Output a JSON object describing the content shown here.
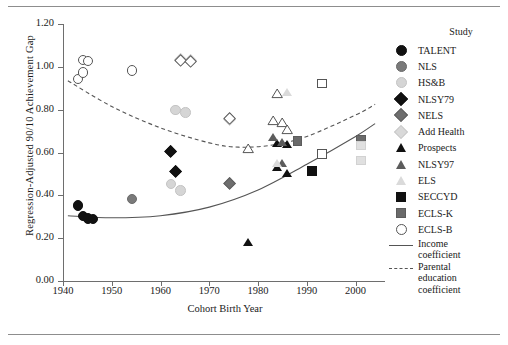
{
  "figure": {
    "legend_title": "Study",
    "line_legend": [
      {
        "id": "income",
        "label_lines": [
          "Income",
          "coefficient"
        ],
        "style": "solid",
        "color": "#555555"
      },
      {
        "id": "parental",
        "label_lines": [
          "Parental",
          "education",
          "coefficient"
        ],
        "style": "dashed",
        "color": "#555555"
      }
    ]
  },
  "chart_data": {
    "type": "scatter",
    "title": "",
    "xlabel": "Cohort Birth Year",
    "ylabel": "Regression-Adjusted 90/10 Achievement Gap",
    "xlim": [
      1940,
      2005
    ],
    "ylim": [
      0.0,
      1.2
    ],
    "xticks": [
      1940,
      1950,
      1960,
      1970,
      1980,
      1990,
      2000
    ],
    "yticks": [
      "0.00",
      "0.20",
      "0.40",
      "0.60",
      "0.80",
      "1.00",
      "1.20"
    ],
    "grid": false,
    "legend_position": "right",
    "series": [
      {
        "name": "TALENT",
        "marker": "circle",
        "fill": "#111111",
        "edge": "#111111",
        "points": [
          [
            1943,
            0.355
          ],
          [
            1944,
            0.305
          ],
          [
            1945,
            0.295
          ],
          [
            1946,
            0.292
          ]
        ]
      },
      {
        "name": "NLS",
        "marker": "circle",
        "fill": "#7a7a7a",
        "edge": "#6a6a6a",
        "points": [
          [
            1954,
            0.385
          ]
        ]
      },
      {
        "name": "HS&B",
        "marker": "circle",
        "fill": "#d5d5d5",
        "edge": "#c4c4c4",
        "points": [
          [
            1962,
            0.455
          ],
          [
            1964,
            0.425
          ],
          [
            1963,
            0.8
          ],
          [
            1965,
            0.79
          ]
        ]
      },
      {
        "name": "NLSY79",
        "marker": "diamond",
        "fill": "#111111",
        "edge": "#111111",
        "points": [
          [
            1962,
            0.605
          ],
          [
            1963,
            0.515
          ]
        ]
      },
      {
        "name": "NELS",
        "marker": "diamond",
        "fill": "#6e6e6e",
        "edge": "#5f5f5f",
        "points": [
          [
            1974,
            0.455
          ]
        ]
      },
      {
        "name": "Add Health",
        "marker": "diamond",
        "fill": "#d9d9d9",
        "edge": "#c9c9c9",
        "points": [
          [
            1964,
            1.035
          ],
          [
            1966,
            1.03
          ],
          [
            1974,
            0.755
          ]
        ]
      },
      {
        "name": "Prospects",
        "marker": "triangle",
        "fill": "#111111",
        "edge": "#111111",
        "points": [
          [
            1978,
            0.175
          ],
          [
            1984,
            0.525
          ],
          [
            1986,
            0.5
          ],
          [
            1984,
            0.64
          ],
          [
            1986,
            0.635
          ]
        ]
      },
      {
        "name": "NLSY97",
        "marker": "triangle",
        "fill": "#5c5c5c",
        "edge": "#4f4f4f",
        "points": [
          [
            1983,
            0.665
          ],
          [
            1985,
            0.645
          ],
          [
            1985,
            0.545
          ]
        ]
      },
      {
        "name": "ELS",
        "marker": "triangle",
        "fill": "#dadada",
        "edge": "#cccccc",
        "points": [
          [
            1986,
            0.875
          ],
          [
            1984,
            0.545
          ]
        ]
      },
      {
        "name": "SECCYD",
        "marker": "square",
        "fill": "#111111",
        "edge": "#111111",
        "points": [
          [
            1991,
            0.515
          ]
        ]
      },
      {
        "name": "ECLS-K",
        "marker": "square",
        "fill": "#6a6a6a",
        "edge": "#5c5c5c",
        "points": [
          [
            1988,
            0.655
          ],
          [
            2001,
            0.66
          ]
        ]
      },
      {
        "name": "ECLS-B",
        "marker": "circle-open",
        "fill": "#ffffff",
        "edge": "#555555",
        "points": [
          [
            1943,
            0.945
          ],
          [
            1944,
            1.035
          ],
          [
            1945,
            1.03
          ],
          [
            1944,
            0.975
          ],
          [
            1954,
            0.985
          ]
        ]
      },
      {
        "name": "Open diamonds",
        "marker": "diamond-open",
        "fill": "#ffffff",
        "edge": "#555555",
        "points": [
          [
            1964,
            1.03
          ],
          [
            1966,
            1.025
          ],
          [
            1974,
            0.76
          ]
        ]
      },
      {
        "name": "Open triangles",
        "marker": "triangle-open",
        "fill": "#ffffff",
        "edge": "#555555",
        "points": [
          [
            1978,
            0.615
          ],
          [
            1983,
            0.745
          ],
          [
            1985,
            0.735
          ],
          [
            1986,
            0.705
          ],
          [
            1984,
            0.87
          ]
        ]
      },
      {
        "name": "Open squares",
        "marker": "square-open",
        "fill": "#ffffff",
        "edge": "#555555",
        "points": [
          [
            1993,
            0.925
          ],
          [
            1993,
            0.595
          ]
        ]
      },
      {
        "name": "Light squares",
        "marker": "square",
        "fill": "#e0e0e0",
        "edge": "#d2d2d2",
        "points": [
          [
            2001,
            0.635
          ],
          [
            2001,
            0.565
          ]
        ]
      }
    ],
    "trend_lines": [
      {
        "name": "Income coefficient",
        "style": "solid",
        "color": "#555555",
        "points": [
          [
            1941,
            0.305
          ],
          [
            1950,
            0.295
          ],
          [
            1960,
            0.305
          ],
          [
            1970,
            0.345
          ],
          [
            1980,
            0.425
          ],
          [
            1990,
            0.545
          ],
          [
            2000,
            0.675
          ],
          [
            2004,
            0.735
          ]
        ]
      },
      {
        "name": "Parental education coefficient",
        "style": "dashed",
        "color": "#555555",
        "points": [
          [
            1941,
            0.935
          ],
          [
            1950,
            0.815
          ],
          [
            1960,
            0.715
          ],
          [
            1970,
            0.645
          ],
          [
            1976,
            0.625
          ],
          [
            1983,
            0.635
          ],
          [
            1990,
            0.675
          ],
          [
            2000,
            0.775
          ],
          [
            2004,
            0.825
          ]
        ]
      }
    ]
  }
}
